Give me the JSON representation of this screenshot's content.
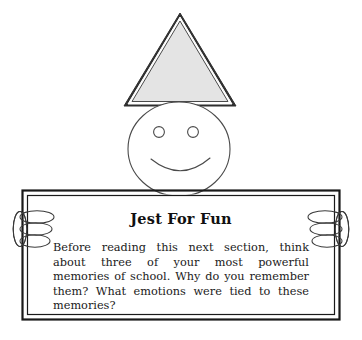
{
  "page": {
    "background_color": "#ffffff",
    "width": 362,
    "height": 340
  },
  "illustration": {
    "name": "stick-figure-holding-sign",
    "description": "Smiling round-headed figure wearing a triangular party hat, holding a rectangular double-bordered sign with both hands",
    "parts": {
      "hat": {
        "name": "party-hat-triangle",
        "fill_color": "#e3e3e3",
        "stroke_color": "#2b2b2b",
        "apex": [
          180,
          13
        ],
        "base_left": [
          127,
          105
        ],
        "base_right": [
          235,
          105
        ]
      },
      "head": {
        "name": "head-circle",
        "fill_color": "#ffffff",
        "stroke_color": "#3a3a3a",
        "center": [
          179,
          149
        ],
        "radius_x": 51,
        "radius_y": 47
      },
      "left_eye": {
        "name": "left-eye",
        "center": [
          159,
          132
        ],
        "radius": 5.5
      },
      "right_eye": {
        "name": "right-eye",
        "center": [
          193,
          132
        ],
        "radius": 5.5
      },
      "mouth": {
        "name": "smile-curve",
        "start": [
          151,
          159
        ],
        "end": [
          210,
          159
        ],
        "dip_y": 175
      },
      "left_hand": {
        "name": "left-hand",
        "fingers": 3,
        "thumb": true
      },
      "right_hand": {
        "name": "right-hand",
        "fingers": 3,
        "thumb": true
      }
    }
  },
  "sign": {
    "name": "jest-for-fun-sign",
    "fill_color": "#ffffff",
    "border_color": "#1a1a1a",
    "outer_rect": [
      22,
      190,
      318,
      130
    ],
    "title": "Jest For Fun",
    "body": "Before reading this next section, think about three of your most powerful memories of school. Why do you remember them? What emotions were tied to these memories?"
  }
}
